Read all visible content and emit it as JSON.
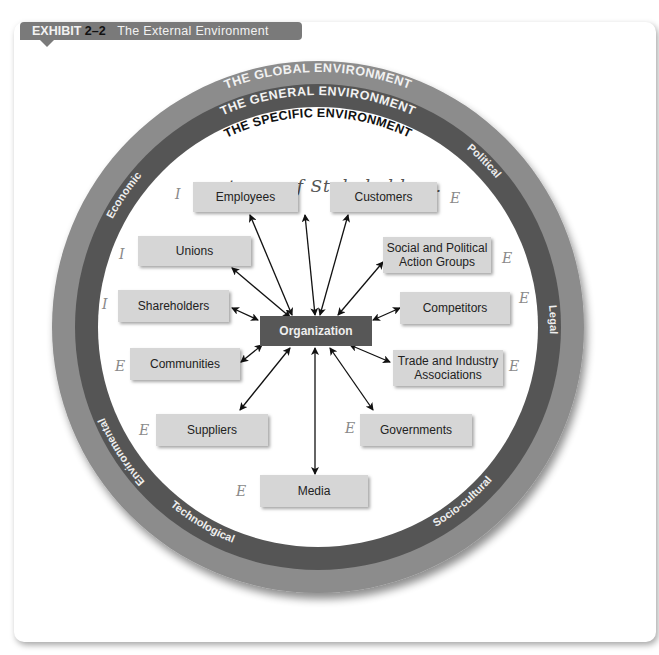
{
  "exhibit": {
    "label": "EXHIBIT",
    "number": "2–2",
    "title": "The External Environment"
  },
  "rings": {
    "global": "THE GLOBAL ENVIRONMENT",
    "general": "THE GENERAL ENVIRONMENT",
    "specific": "THE SPECIFIC ENVIRONMENT"
  },
  "general_factors": [
    "Economic",
    "Political",
    "Legal",
    "Socio-cultural",
    "Technological",
    "Environmental"
  ],
  "center": "Organization",
  "stakeholders": [
    {
      "label": "Employees",
      "mark": "I"
    },
    {
      "label": "Customers",
      "mark": "E"
    },
    {
      "label": "Unions",
      "mark": "I"
    },
    {
      "label": "Social and Political Action Groups",
      "mark": "E"
    },
    {
      "label": "Shareholders",
      "mark": "I"
    },
    {
      "label": "Competitors",
      "mark": "E"
    },
    {
      "label": "Communities",
      "mark": "E"
    },
    {
      "label": "Trade and Industry Associations",
      "mark": "E"
    },
    {
      "label": "Suppliers",
      "mark": "E"
    },
    {
      "label": "Governments",
      "mark": "E"
    },
    {
      "label": "Media",
      "mark": "E"
    }
  ],
  "handwritten_note": "types of Stakeholders.",
  "colors": {
    "outer_ring": "#8c8c8c",
    "middle_ring": "#555555",
    "box_fill": "#d6d6d6",
    "center_fill": "#575757",
    "tab_fill": "#7a7a7a"
  }
}
